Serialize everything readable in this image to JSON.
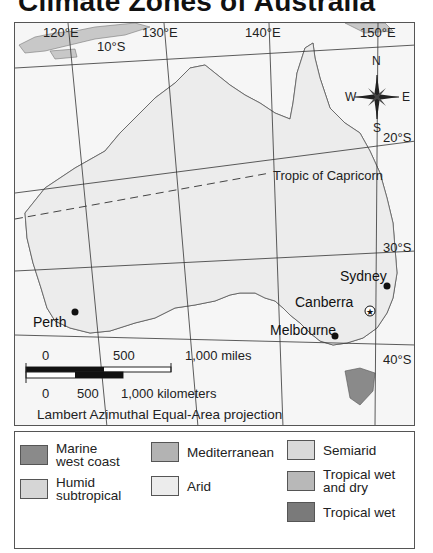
{
  "title": "Climate Zones of Australia",
  "map": {
    "longitudes": [
      "120°E",
      "130°E",
      "140°E",
      "150°E"
    ],
    "latitudes": [
      "10°S",
      "20°S",
      "30°S",
      "40°S"
    ],
    "tropic_label": "Tropic of Capricorn",
    "compass": {
      "n": "N",
      "s": "S",
      "e": "E",
      "w": "W"
    },
    "cities": [
      {
        "name": "Perth"
      },
      {
        "name": "Sydney"
      },
      {
        "name": "Canberra",
        "capital": true
      },
      {
        "name": "Melbourne"
      }
    ],
    "scale": {
      "miles": [
        "0",
        "500",
        "1,000 miles"
      ],
      "km": [
        "0",
        "500",
        "1,000 kilometers"
      ]
    },
    "projection": "Lambert Azimuthal Equal-Area projection"
  },
  "legend": {
    "items": [
      {
        "label": "Marine west coast",
        "line1": "Marine",
        "line2": "west coast",
        "color": "#8a8a8a"
      },
      {
        "label": "Humid subtropical",
        "line1": "Humid",
        "line2": "subtropical",
        "color": "#d6d6d6"
      },
      {
        "label": "Mediterranean",
        "color": "#b3b3b3"
      },
      {
        "label": "Arid",
        "color": "#ececec"
      },
      {
        "label": "Semiarid",
        "color": "#d9d9d9"
      },
      {
        "label": "Tropical wet and dry",
        "line1": "Tropical wet",
        "line2": "and dry",
        "color": "#b8b8b8"
      },
      {
        "label": "Tropical wet",
        "color": "#7a7a7a"
      }
    ]
  }
}
